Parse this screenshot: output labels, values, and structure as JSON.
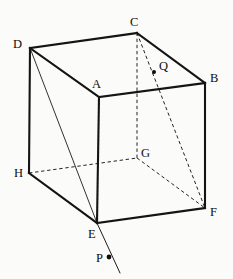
{
  "figure": {
    "background_color": "#fbfbfa",
    "line_color": "#141414",
    "canvas": {
      "width": 233,
      "height": 279
    },
    "vertices": [
      {
        "name": "A",
        "label": "A",
        "x": 99,
        "y": 97,
        "label_x": 92,
        "label_y": 88,
        "hidden": false
      },
      {
        "name": "B",
        "label": "B",
        "x": 205,
        "y": 83,
        "label_x": 210,
        "label_y": 82,
        "hidden": false
      },
      {
        "name": "C",
        "label": "C",
        "x": 137,
        "y": 33,
        "label_x": 130,
        "label_y": 26,
        "hidden": false
      },
      {
        "name": "D",
        "label": "D",
        "x": 30,
        "y": 48,
        "label_x": 13,
        "label_y": 48,
        "hidden": false
      },
      {
        "name": "E",
        "label": "E",
        "x": 97,
        "y": 223,
        "label_x": 88,
        "label_y": 238,
        "hidden": false
      },
      {
        "name": "F",
        "label": "F",
        "x": 205,
        "y": 208,
        "label_x": 210,
        "label_y": 216,
        "hidden": false
      },
      {
        "name": "G",
        "label": "G",
        "x": 137,
        "y": 158,
        "label_x": 141,
        "label_y": 157,
        "hidden": true
      },
      {
        "name": "H",
        "label": "H",
        "x": 29,
        "y": 173,
        "label_x": 14,
        "label_y": 177,
        "hidden": false
      }
    ],
    "marked_points": [
      {
        "name": "Q",
        "label": "Q",
        "x": 154,
        "y": 72,
        "label_x": 159,
        "label_y": 70,
        "dot_radius": 2.0,
        "on_segment": "C-F"
      },
      {
        "name": "P",
        "label": "P",
        "x": 109,
        "y": 257,
        "label_x": 96,
        "label_y": 262,
        "dot_radius": 2.4,
        "on_segment": "E-ray"
      }
    ],
    "edges_solid": [
      {
        "from": "D",
        "to": "C",
        "weight": "thick"
      },
      {
        "from": "C",
        "to": "B",
        "weight": "thick"
      },
      {
        "from": "D",
        "to": "A",
        "weight": "thick"
      },
      {
        "from": "A",
        "to": "B",
        "weight": "thick"
      },
      {
        "from": "D",
        "to": "H",
        "weight": "thick"
      },
      {
        "from": "A",
        "to": "E",
        "weight": "thick"
      },
      {
        "from": "B",
        "to": "F",
        "weight": "thick"
      },
      {
        "from": "H",
        "to": "E",
        "weight": "thick"
      },
      {
        "from": "E",
        "to": "F",
        "weight": "thick"
      }
    ],
    "edges_hidden": [
      {
        "from": "H",
        "to": "G",
        "style": "dashed"
      },
      {
        "from": "G",
        "to": "F",
        "style": "dashed"
      },
      {
        "from": "G",
        "to": "C",
        "style": "dashed"
      }
    ],
    "construction_lines": [
      {
        "from": "D",
        "to": "E",
        "style": "solid-thin",
        "description": "diagonal D to E"
      },
      {
        "from": "C",
        "to": "F",
        "style": "dashed",
        "description": "diagonal C to F through Q"
      }
    ],
    "rays": [
      {
        "from": "E",
        "through": "P",
        "to_x": 120,
        "to_y": 273,
        "style": "solid-thin",
        "description": "ray from E through P"
      }
    ]
  }
}
